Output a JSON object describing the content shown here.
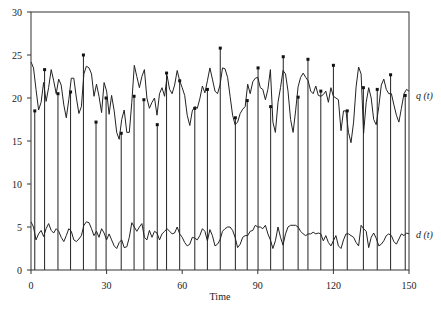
{
  "chart_data": {
    "type": "line",
    "title": "",
    "xlabel": "Time",
    "ylabel": "",
    "xlim": [
      0,
      150
    ],
    "ylim": [
      0,
      30
    ],
    "grid": false,
    "x_ticks": [
      0,
      30,
      60,
      90,
      120,
      150
    ],
    "y_ticks": [
      0,
      5,
      10,
      15,
      20,
      25,
      30
    ],
    "x_tick_labels": [
      "0",
      "30",
      "60",
      "90",
      "120",
      "150"
    ],
    "y_tick_labels": [
      "0",
      "5",
      "10",
      "15",
      "20",
      "25",
      "30"
    ],
    "series": [
      {
        "name": "q (t)",
        "style": "line",
        "x": [
          0,
          1,
          2,
          3,
          4,
          5,
          6,
          7,
          8,
          9,
          10,
          11,
          12,
          13,
          14,
          15,
          16,
          17,
          18,
          19,
          20,
          21,
          22,
          23,
          24,
          25,
          26,
          27,
          28,
          29,
          30,
          31,
          32,
          33,
          34,
          35,
          36,
          37,
          38,
          39,
          40,
          41,
          42,
          43,
          44,
          45,
          46,
          47,
          48,
          49,
          50,
          51,
          52,
          53,
          54,
          55,
          56,
          57,
          58,
          59,
          60,
          61,
          62,
          63,
          64,
          65,
          66,
          67,
          68,
          69,
          70,
          71,
          72,
          73,
          74,
          75,
          76,
          77,
          78,
          79,
          80,
          81,
          82,
          83,
          84,
          85,
          86,
          87,
          88,
          89,
          90,
          91,
          92,
          93,
          94,
          95,
          96,
          97,
          98,
          99,
          100,
          101,
          102,
          103,
          104,
          105,
          106,
          107,
          108,
          109,
          110,
          111,
          112,
          113,
          114,
          115,
          116,
          117,
          118,
          119,
          120,
          121,
          122,
          123,
          124,
          125,
          126,
          127,
          128,
          129,
          130,
          131,
          132,
          133,
          134,
          135,
          136,
          137,
          138,
          139,
          140,
          141,
          142,
          143,
          144,
          145,
          146,
          147,
          148,
          149,
          150
        ],
        "values": [
          24.2,
          23.5,
          21.0,
          18.6,
          19.5,
          21.8,
          19.6,
          21.2,
          23.3,
          22.0,
          20.5,
          22.2,
          21.5,
          19.2,
          17.7,
          19.8,
          22.3,
          22.3,
          20.0,
          18.2,
          19.0,
          22.8,
          23.7,
          23.5,
          22.8,
          20.2,
          21.6,
          20.2,
          18.3,
          21.8,
          20.8,
          18.1,
          20.3,
          18.5,
          16.0,
          15.2,
          17.5,
          18.6,
          16.0,
          16.0,
          19.5,
          23.8,
          22.5,
          21.2,
          22.5,
          23.3,
          20.0,
          18.8,
          19.5,
          20.0,
          18.0,
          20.5,
          21.2,
          20.2,
          22.6,
          21.0,
          20.5,
          21.5,
          23.2,
          22.0,
          21.2,
          20.3,
          18.0,
          16.8,
          18.5,
          19.0,
          18.8,
          19.9,
          21.4,
          20.6,
          22.0,
          23.5,
          22.2,
          20.8,
          20.5,
          21.5,
          23.5,
          23.4,
          22.4,
          20.2,
          18.0,
          16.9,
          17.2,
          18.2,
          18.7,
          19.0,
          21.6,
          20.5,
          21.9,
          22.3,
          22.4,
          21.2,
          21.0,
          19.8,
          21.0,
          23.3,
          17.2,
          16.0,
          19.5,
          21.2,
          23.2,
          22.8,
          20.8,
          17.5,
          16.0,
          18.5,
          21.3,
          22.4,
          22.9,
          22.4,
          22.0,
          20.8,
          20.5,
          21.4,
          20.3,
          20.2,
          20.4,
          20.8,
          19.5,
          21.2,
          20.2,
          20.0,
          19.8,
          16.2,
          18.5,
          18.5,
          16.0,
          14.8,
          17.2,
          21.3,
          23.6,
          22.8,
          15.9,
          19.5,
          21.2,
          20.0,
          17.5,
          16.9,
          19.0,
          21.5,
          22.2,
          21.0,
          20.5,
          20.5,
          19.2,
          18.0,
          17.2,
          18.8,
          20.5,
          21.0,
          20.8
        ],
        "label_position": "right"
      },
      {
        "name": "d (t)",
        "style": "line",
        "x": [
          0,
          1,
          2,
          3,
          4,
          5,
          6,
          7,
          8,
          9,
          10,
          11,
          12,
          13,
          14,
          15,
          16,
          17,
          18,
          19,
          20,
          21,
          22,
          23,
          24,
          25,
          26,
          27,
          28,
          29,
          30,
          31,
          32,
          33,
          34,
          35,
          36,
          37,
          38,
          39,
          40,
          41,
          42,
          43,
          44,
          45,
          46,
          47,
          48,
          49,
          50,
          51,
          52,
          53,
          54,
          55,
          56,
          57,
          58,
          59,
          60,
          61,
          62,
          63,
          64,
          65,
          66,
          67,
          68,
          69,
          70,
          71,
          72,
          73,
          74,
          75,
          76,
          77,
          78,
          79,
          80,
          81,
          82,
          83,
          84,
          85,
          86,
          87,
          88,
          89,
          90,
          91,
          92,
          93,
          94,
          95,
          96,
          97,
          98,
          99,
          100,
          101,
          102,
          103,
          104,
          105,
          106,
          107,
          108,
          109,
          110,
          111,
          112,
          113,
          114,
          115,
          116,
          117,
          118,
          119,
          120,
          121,
          122,
          123,
          124,
          125,
          126,
          127,
          128,
          129,
          130,
          131,
          132,
          133,
          134,
          135,
          136,
          137,
          138,
          139,
          140,
          141,
          142,
          143,
          144,
          145,
          146,
          147,
          148,
          149,
          150
        ],
        "values": [
          5.6,
          5.0,
          3.5,
          4.2,
          4.6,
          3.9,
          4.8,
          5.4,
          4.6,
          4.3,
          4.8,
          4.5,
          3.8,
          3.3,
          4.0,
          4.8,
          4.5,
          3.5,
          3.3,
          3.6,
          4.0,
          5.2,
          5.6,
          5.5,
          4.8,
          4.0,
          4.5,
          3.8,
          4.8,
          4.3,
          3.5,
          4.2,
          3.5,
          2.8,
          2.5,
          3.2,
          3.5,
          2.6,
          2.7,
          3.8,
          5.5,
          5.0,
          4.5,
          5.0,
          5.4,
          3.8,
          3.5,
          4.6,
          3.8,
          4.5,
          4.3,
          3.5,
          4.2,
          4.5,
          4.8,
          4.5,
          4.2,
          4.3,
          5.0,
          4.2,
          3.8,
          3.2,
          2.8,
          3.0,
          3.8,
          3.7,
          3.5,
          4.0,
          4.8,
          4.5,
          3.4,
          4.7,
          4.0,
          2.8,
          3.0,
          3.5,
          4.5,
          4.8,
          5.0,
          5.0,
          4.6,
          3.8,
          2.6,
          3.0,
          3.8,
          4.0,
          4.0,
          4.5,
          4.6,
          5.2,
          5.0,
          5.0,
          4.8,
          5.2,
          4.2,
          3.5,
          2.5,
          3.4,
          5.0,
          3.8,
          2.9,
          4.2,
          5.0,
          5.2,
          5.2,
          5.2,
          5.0,
          4.5,
          4.2,
          4.0,
          4.2,
          4.2,
          4.4,
          4.2,
          4.3,
          4.2,
          3.4,
          4.0,
          3.2,
          2.8,
          3.4,
          4.0,
          2.8,
          2.5,
          3.5,
          4.2,
          4.2,
          4.0,
          3.8,
          3.2,
          2.8,
          5.2,
          4.8,
          4.5,
          2.6,
          3.8,
          4.3,
          3.7,
          2.8,
          3.0,
          3.4,
          4.0,
          4.2,
          4.0,
          3.3,
          3.0,
          3.6,
          4.2,
          4.0,
          4.3,
          4.2
        ],
        "label_position": "right"
      },
      {
        "name": "pulses",
        "style": "stem",
        "x": [
          1.5,
          5.4,
          10.7,
          15.7,
          20.8,
          25.8,
          29.8,
          35.8,
          40.9,
          44.8,
          50.1,
          53.8,
          59.0,
          65.0,
          70.0,
          75.1,
          81.1,
          85.8,
          90.1,
          95.1,
          100.1,
          106.0,
          109.9,
          115.0,
          120.0,
          125.5,
          131.9,
          137.4,
          142.7,
          148.5
        ],
        "values": [
          18.5,
          23.3,
          20.5,
          20.7,
          25.0,
          17.2,
          20.0,
          15.9,
          20.2,
          19.8,
          16.9,
          22.9,
          22.0,
          18.8,
          21.0,
          25.8,
          17.7,
          19.7,
          23.5,
          19.0,
          24.8,
          20.1,
          24.5,
          20.8,
          23.8,
          18.5,
          21.2,
          21.0,
          22.7,
          20.3
        ]
      }
    ]
  }
}
